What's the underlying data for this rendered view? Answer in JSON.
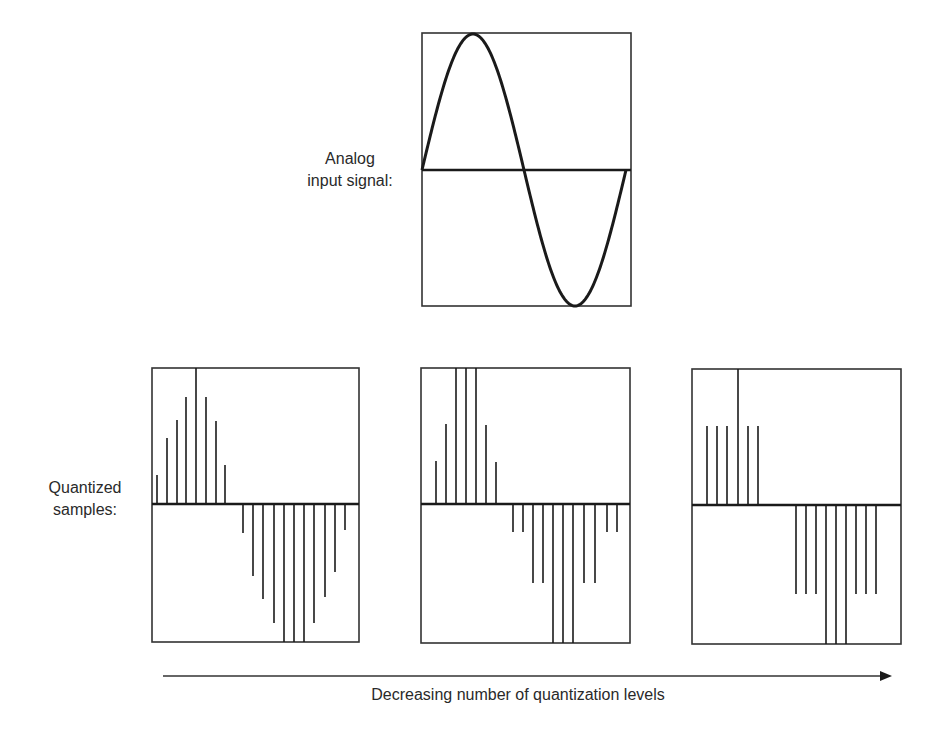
{
  "labels": {
    "analog_line1": "Analog",
    "analog_line2": "input signal:",
    "quantized_line1": "Quantized",
    "quantized_line2": "samples:",
    "arrow_caption": "Decreasing number of quantization levels"
  },
  "colors": {
    "stroke": "#1a1a1a",
    "frame": "#333333",
    "background": "#ffffff"
  },
  "analog_panel": {
    "box": {
      "x": 422,
      "y": 33,
      "w": 209,
      "h": 273
    },
    "axis_y": 170,
    "wave": {
      "x_start": 422,
      "x_end": 626,
      "amplitude": 136,
      "periods": 1
    }
  },
  "quantized_panels": [
    {
      "name": "many-levels",
      "box": {
        "x": 152,
        "y": 368,
        "w": 207,
        "h": 274
      },
      "axis_y": 504,
      "stems": [
        {
          "x": 157,
          "y": 475
        },
        {
          "x": 167,
          "y": 438
        },
        {
          "x": 177,
          "y": 420
        },
        {
          "x": 186,
          "y": 397
        },
        {
          "x": 196,
          "y": 368
        },
        {
          "x": 206,
          "y": 397
        },
        {
          "x": 216,
          "y": 421
        },
        {
          "x": 225,
          "y": 465
        },
        {
          "x": 243,
          "y": 533
        },
        {
          "x": 253,
          "y": 576
        },
        {
          "x": 263,
          "y": 599
        },
        {
          "x": 274,
          "y": 623
        },
        {
          "x": 284,
          "y": 642
        },
        {
          "x": 294,
          "y": 642
        },
        {
          "x": 304,
          "y": 642
        },
        {
          "x": 314,
          "y": 623
        },
        {
          "x": 325,
          "y": 597
        },
        {
          "x": 335,
          "y": 572
        },
        {
          "x": 345,
          "y": 530
        }
      ]
    },
    {
      "name": "fewer-levels",
      "box": {
        "x": 421,
        "y": 368,
        "w": 209,
        "h": 275
      },
      "axis_y": 504,
      "stems": [
        {
          "x": 436,
          "y": 461
        },
        {
          "x": 446,
          "y": 424
        },
        {
          "x": 456,
          "y": 368
        },
        {
          "x": 466,
          "y": 368
        },
        {
          "x": 476,
          "y": 368
        },
        {
          "x": 486,
          "y": 425
        },
        {
          "x": 496,
          "y": 462
        },
        {
          "x": 513,
          "y": 532
        },
        {
          "x": 523,
          "y": 532
        },
        {
          "x": 533,
          "y": 583
        },
        {
          "x": 543,
          "y": 583
        },
        {
          "x": 553,
          "y": 643
        },
        {
          "x": 563,
          "y": 643
        },
        {
          "x": 573,
          "y": 643
        },
        {
          "x": 584,
          "y": 583
        },
        {
          "x": 595,
          "y": 583
        },
        {
          "x": 607,
          "y": 532
        },
        {
          "x": 617,
          "y": 532
        }
      ]
    },
    {
      "name": "fewest-levels",
      "box": {
        "x": 692,
        "y": 369,
        "w": 209,
        "h": 275
      },
      "axis_y": 505,
      "stems": [
        {
          "x": 707,
          "y": 426
        },
        {
          "x": 717,
          "y": 426
        },
        {
          "x": 727,
          "y": 426
        },
        {
          "x": 738,
          "y": 369
        },
        {
          "x": 748,
          "y": 426
        },
        {
          "x": 758,
          "y": 426
        },
        {
          "x": 796,
          "y": 594
        },
        {
          "x": 806,
          "y": 594
        },
        {
          "x": 816,
          "y": 594
        },
        {
          "x": 826,
          "y": 644
        },
        {
          "x": 836,
          "y": 644
        },
        {
          "x": 846,
          "y": 644
        },
        {
          "x": 856,
          "y": 594
        },
        {
          "x": 866,
          "y": 594
        },
        {
          "x": 876,
          "y": 594
        }
      ]
    }
  ],
  "arrow": {
    "x1": 163,
    "y": 676,
    "x2": 892,
    "head_len": 12,
    "head_half": 5
  }
}
